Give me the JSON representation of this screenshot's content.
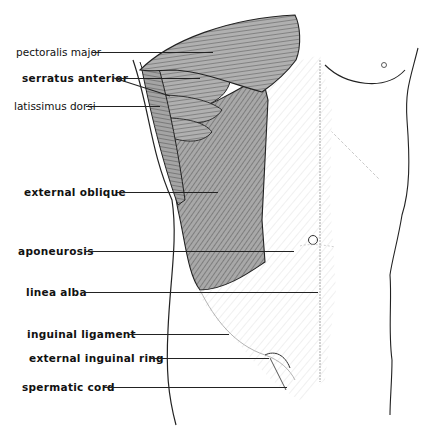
{
  "figure": {
    "type": "anatomical-illustration",
    "labels": [
      {
        "text": "pectoralis major",
        "bold": false,
        "x": 16,
        "y": 46,
        "line_x1": 92,
        "line_x2": 213,
        "line_y": 52
      },
      {
        "text": "serratus anterior",
        "bold": true,
        "x": 22,
        "y": 72,
        "line_x1": 115,
        "line_x2": 200,
        "line_y": 78
      },
      {
        "text": "latissimus dorsi",
        "bold": false,
        "x": 14,
        "y": 100,
        "line_x1": 86,
        "line_x2": 160,
        "line_y": 106
      },
      {
        "text": "external oblique",
        "bold": true,
        "x": 24,
        "y": 186,
        "line_x1": 117,
        "line_x2": 218,
        "line_y": 192
      },
      {
        "text": "aponeurosis",
        "bold": true,
        "x": 18,
        "y": 245,
        "line_x1": 86,
        "line_x2": 294,
        "line_y": 251
      },
      {
        "text": "linea alba",
        "bold": true,
        "x": 26,
        "y": 286,
        "line_x1": 82,
        "line_x2": 318,
        "line_y": 292
      },
      {
        "text": "inguinal ligament",
        "bold": true,
        "x": 27,
        "y": 328,
        "line_x1": 128,
        "line_x2": 229,
        "line_y": 334
      },
      {
        "text": "external inguinal ring",
        "bold": true,
        "x": 29,
        "y": 352,
        "line_x1": 150,
        "line_x2": 269,
        "line_y": 358
      },
      {
        "text": "spermatic cord",
        "bold": true,
        "x": 22,
        "y": 381,
        "line_x1": 103,
        "line_x2": 287,
        "line_y": 387
      }
    ]
  },
  "caption": {
    "text": "",
    "note": "caption text cut off at bottom edge"
  },
  "colors": {
    "muscle_fill": "#9a9a9a",
    "muscle_dark": "#555555",
    "aponeurosis": "#d6d6d6",
    "outline": "#222222",
    "background": "#ffffff"
  }
}
